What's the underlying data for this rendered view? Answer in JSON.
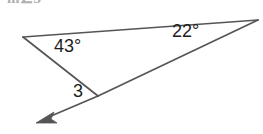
{
  "figure": {
    "kind": "triangle-with-exterior-ray",
    "canvas": {
      "width": 263,
      "height": 134
    },
    "background_color": "#ffffff",
    "stroke_color": "#555555",
    "text_color": "#1d1d1d",
    "clipped_stem_text": "m∠3",
    "labels": {
      "angle_left": "43°",
      "angle_right": "22°",
      "angle_marked": "3"
    },
    "values": {
      "angle_left_degrees": 43,
      "angle_right_degrees": 22,
      "unknown_angle_name": "3"
    },
    "vertices": {
      "left": {
        "x": 23,
        "y": 37
      },
      "right": {
        "x": 258,
        "y": 20
      },
      "middle": {
        "x": 98,
        "y": 96
      },
      "ray_tip": {
        "x": 38,
        "y": 122
      }
    }
  }
}
